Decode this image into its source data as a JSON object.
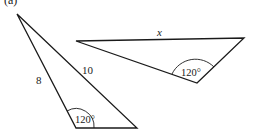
{
  "figure_label": "(a)",
  "triangles": [
    {
      "name": "triangle-left",
      "vertices": [
        [
          17,
          14
        ],
        [
          76,
          128
        ],
        [
          137,
          128
        ]
      ],
      "side_labels": {
        "left_side": "8",
        "right_side": "10"
      },
      "angle_label": "120°"
    },
    {
      "name": "triangle-right",
      "vertices": [
        [
          76,
          41
        ],
        [
          244,
          38
        ],
        [
          197,
          83
        ]
      ],
      "side_labels": {
        "top_side": "x"
      },
      "angle_label": "120°"
    }
  ],
  "colors": {
    "stroke": "#1a1a1a",
    "background": "#ffffff"
  }
}
